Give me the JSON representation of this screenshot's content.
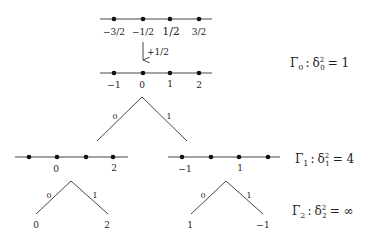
{
  "colors": {
    "line": "#333333",
    "dot": "#111111",
    "text": "#222222",
    "background": "#ffffff"
  },
  "top_line": {
    "labels": [
      "−3/2",
      "−1/2",
      "1/2",
      "3/2"
    ]
  },
  "shift_arrow": {
    "label": "+1/2",
    "icon": "down-arrow-icon"
  },
  "level0_line": {
    "labels": [
      "−1",
      "0",
      "1",
      "2"
    ]
  },
  "tree0": {
    "left_edge_label": "0",
    "right_edge_label": "1"
  },
  "level1_left_line": {
    "labels": [
      "0",
      "2"
    ]
  },
  "level1_right_line": {
    "labels": [
      "−1",
      "1"
    ]
  },
  "tree2_left": {
    "left_edge_label": "0",
    "right_edge_label": "1",
    "left_leaf": "0",
    "right_leaf": "2"
  },
  "tree2_right": {
    "left_edge_label": "0",
    "right_edge_label": "1",
    "left_leaf": "1",
    "right_leaf": "−1"
  },
  "gamma_labels": {
    "g0": {
      "name": "Γ",
      "sub": "0",
      "delta": "δ",
      "dsub": "0",
      "dsup": "2",
      "rhs": "= 1"
    },
    "g1": {
      "name": "Γ",
      "sub": "1",
      "delta": "δ",
      "dsub": "1",
      "dsup": "2",
      "rhs": "= 4"
    },
    "g2": {
      "name": "Γ",
      "sub": "2",
      "delta": "δ",
      "dsub": "2",
      "dsup": "2",
      "rhs": "= ∞"
    }
  }
}
